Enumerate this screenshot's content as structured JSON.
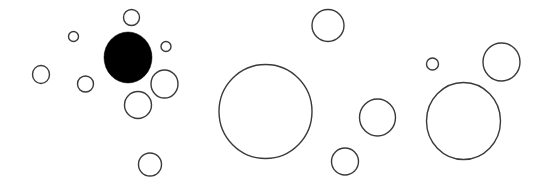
{
  "canvas": {
    "width": 549,
    "height": 188,
    "background": "#ffffff"
  },
  "style": {
    "stroke_color": "#3a3a3a",
    "stroke_width": 1.4,
    "outline_fill": "#ffffff",
    "filled_fill": "#000000"
  },
  "circles": [
    {
      "cx": 131.5,
      "cy": 17.5,
      "rx": 8,
      "ry": 8,
      "filled": false
    },
    {
      "cx": 73.5,
      "cy": 36.5,
      "rx": 5,
      "ry": 5,
      "filled": false
    },
    {
      "cx": 166,
      "cy": 46.5,
      "rx": 5,
      "ry": 5,
      "filled": false
    },
    {
      "cx": 128,
      "cy": 57.5,
      "rx": 24,
      "ry": 25.5,
      "filled": true
    },
    {
      "cx": 41,
      "cy": 74.5,
      "rx": 8.5,
      "ry": 9,
      "filled": false
    },
    {
      "cx": 85.5,
      "cy": 84,
      "rx": 8,
      "ry": 8,
      "filled": false
    },
    {
      "cx": 164.5,
      "cy": 84,
      "rx": 13.5,
      "ry": 14,
      "filled": false
    },
    {
      "cx": 138,
      "cy": 105,
      "rx": 13.5,
      "ry": 13.5,
      "filled": false
    },
    {
      "cx": 150,
      "cy": 164.5,
      "rx": 11.5,
      "ry": 11.5,
      "filled": false
    },
    {
      "cx": 265.5,
      "cy": 111.5,
      "rx": 46.5,
      "ry": 47,
      "filled": false
    },
    {
      "cx": 328,
      "cy": 25.5,
      "rx": 16,
      "ry": 16,
      "filled": false
    },
    {
      "cx": 377.5,
      "cy": 117.5,
      "rx": 18,
      "ry": 18.5,
      "filled": false
    },
    {
      "cx": 345,
      "cy": 161.5,
      "rx": 13.5,
      "ry": 13.5,
      "filled": false
    },
    {
      "cx": 432.5,
      "cy": 64,
      "rx": 6,
      "ry": 6,
      "filled": false
    },
    {
      "cx": 501.5,
      "cy": 62,
      "rx": 18.5,
      "ry": 19,
      "filled": false
    },
    {
      "cx": 463.5,
      "cy": 121,
      "rx": 37,
      "ry": 38.5,
      "filled": false
    }
  ]
}
